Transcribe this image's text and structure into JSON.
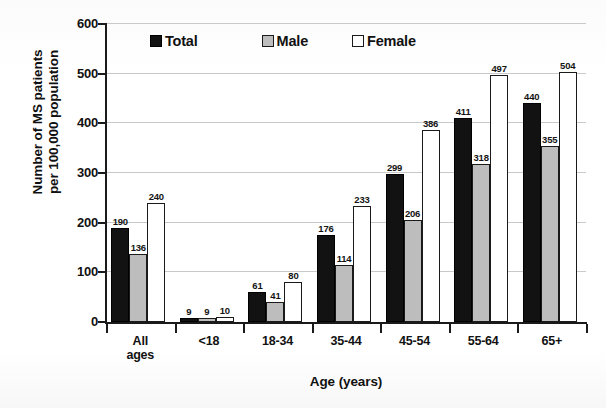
{
  "chart_data": {
    "type": "bar",
    "title": "",
    "xlabel": "Age (years)",
    "ylabel": "Number of MS patients\nper 100,000 population",
    "categories": [
      "All\nages",
      "<18",
      "18-34",
      "35-44",
      "45-54",
      "55-64",
      "65+"
    ],
    "series": [
      {
        "name": "Total",
        "color": "#121212",
        "values": [
          190,
          9,
          61,
          176,
          299,
          411,
          440
        ]
      },
      {
        "name": "Male",
        "color": "#bdbdbd",
        "values": [
          136,
          9,
          41,
          114,
          206,
          318,
          355
        ]
      },
      {
        "name": "Female",
        "color": "#ffffff",
        "values": [
          240,
          10,
          80,
          233,
          386,
          497,
          504
        ]
      }
    ],
    "ylim": [
      0,
      600
    ],
    "yticks": [
      0,
      100,
      200,
      300,
      400,
      500,
      600
    ],
    "ytick_labels": [
      "0",
      "100",
      "200",
      "300",
      "400",
      "500",
      "600"
    ],
    "grid": true,
    "legend_position": "top-inside"
  }
}
